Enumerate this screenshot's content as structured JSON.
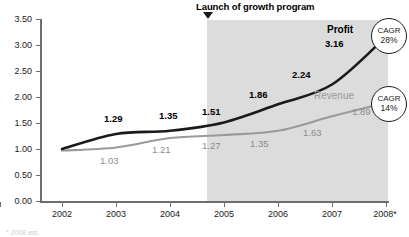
{
  "annotation": {
    "title": "Launch of growth program",
    "marker_icon": "triangle-down-icon",
    "start_year": "2005"
  },
  "series_labels": {
    "profit": "Profit",
    "revenue": "Revenue"
  },
  "badges": [
    {
      "name": "cagr-profit",
      "word": "CAGR",
      "pct": "28%"
    },
    {
      "name": "cagr-revenue",
      "word": "CAGR",
      "pct": "14%"
    }
  ],
  "footnote": "* 2008 est.",
  "colors": {
    "profit_line": "#1a1a1a",
    "revenue_line": "#9a9a9a",
    "shaded_region": "#dcdcdc",
    "axis": "#6e6e6e",
    "background": "#ffffff"
  },
  "chart_data": {
    "type": "line",
    "title": "Launch of growth program",
    "xlabel": "",
    "ylabel": "",
    "ylim": [
      0.0,
      3.5
    ],
    "grid": false,
    "legend_position": "inline-end-of-line",
    "categories": [
      "2002",
      "2003",
      "2004",
      "2005",
      "2006",
      "2007",
      "2008*"
    ],
    "ytick_labels": [
      "0.00",
      "0.50",
      "1.00",
      "1.50",
      "2.00",
      "2.50",
      "3.00",
      "3.50"
    ],
    "ytick_values": [
      0.0,
      0.5,
      1.0,
      1.5,
      2.0,
      2.5,
      3.0,
      3.5
    ],
    "series": [
      {
        "name": "Profit",
        "color": "#1a1a1a",
        "values": [
          1.0,
          1.29,
          1.35,
          1.51,
          1.86,
          2.24,
          3.16
        ],
        "labels": [
          "",
          "1.29",
          "1.35",
          "1.51",
          "1.86",
          "2.24",
          "3.16"
        ],
        "cagr": "28%"
      },
      {
        "name": "Revenue",
        "color": "#9a9a9a",
        "values": [
          0.97,
          1.03,
          1.21,
          1.27,
          1.35,
          1.63,
          1.89
        ],
        "labels": [
          "",
          "1.03",
          "1.21",
          "1.27",
          "1.35",
          "1.63",
          "1.89"
        ],
        "cagr": "14%"
      }
    ],
    "annotations": [
      {
        "text": "Launch of growth program",
        "at_category": "2005",
        "type": "marker-down"
      }
    ],
    "shaded_x_range": [
      "2005",
      "2008*"
    ]
  }
}
